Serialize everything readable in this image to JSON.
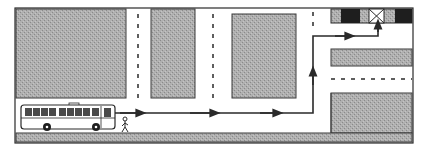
{
  "diagram": {
    "type": "route-map",
    "description": "Street map showing a bus at a stop, a pedestrian, and a route with arrows leading to a destination building marked with an X",
    "colors": {
      "background": "#ffffff",
      "block_fill": "#a8a8a8",
      "block_stroke": "#3a3a3a",
      "frame_stroke": "#2a2a2a",
      "route": "#2a2a2a",
      "dark_building": "#1e1e1e",
      "lane_marking": "#2a2a2a"
    },
    "elements": {
      "bus": {
        "label": "bus",
        "windows": 10
      },
      "pedestrian": {
        "label": "pedestrian"
      },
      "destination": {
        "label": "destination",
        "marker": "X"
      },
      "route": {
        "label": "route",
        "segments": [
          "east along bottom road",
          "north up side street",
          "east along top road",
          "north to destination"
        ],
        "arrow_count": 5
      },
      "blocks": [
        {
          "id": "block-top-left"
        },
        {
          "id": "block-top-middle"
        },
        {
          "id": "block-top-center"
        },
        {
          "id": "block-right-middle"
        },
        {
          "id": "block-right-bottom"
        },
        {
          "id": "sidewalk-bottom"
        }
      ]
    }
  }
}
